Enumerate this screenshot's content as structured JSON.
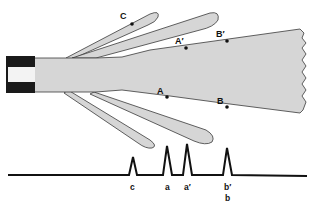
{
  "diagram": {
    "colors": {
      "background": "#ffffff",
      "jet_fill": "#d6d6d6",
      "jet_stroke": "#3a3a3a",
      "nozzle": "#1a1a1a",
      "trace": "#111111"
    },
    "points": {
      "C": "C",
      "A_prime": "A′",
      "B_prime": "B′",
      "A": "A",
      "B": "B"
    },
    "peaks": {
      "c": "c",
      "a": "a",
      "a_prime": "a′",
      "b_prime": "b′",
      "b": "b"
    }
  }
}
